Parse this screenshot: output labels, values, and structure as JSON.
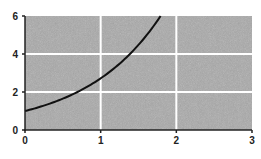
{
  "chart_data": {
    "type": "line",
    "title": "",
    "xlabel": "",
    "ylabel": "",
    "xlim": [
      0,
      3
    ],
    "ylim": [
      0,
      6
    ],
    "x_ticks": [
      "0",
      "1",
      "2",
      "3"
    ],
    "y_ticks": [
      "0",
      "2",
      "4",
      "6"
    ],
    "grid": true,
    "legend": null,
    "series": [
      {
        "name": "y = e^x",
        "x": [
          0,
          0.25,
          0.5,
          0.75,
          1.0,
          1.25,
          1.5,
          1.75,
          1.79
        ],
        "values": [
          1.0,
          1.28,
          1.65,
          2.12,
          2.72,
          3.49,
          4.48,
          5.75,
          6.0
        ]
      }
    ]
  },
  "colors": {
    "plot_background": "#a9a9a9",
    "grid": "#ffffff",
    "curve": "#111111",
    "axis": "#222222"
  }
}
